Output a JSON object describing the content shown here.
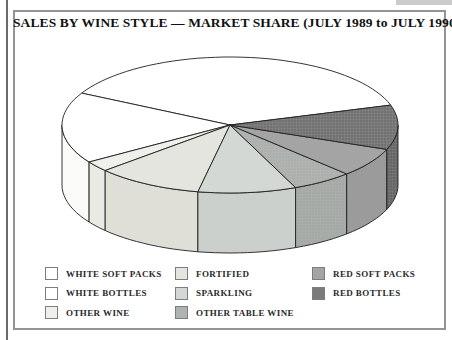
{
  "title": "SALES BY WINE STYLE — MARKET SHARE (JULY 1989 to JULY 1990)",
  "chart_data": {
    "type": "pie",
    "style": "3d-grayscale",
    "title": "SALES BY WINE STYLE — MARKET SHARE (JULY 1989 to JULY 1990)",
    "period": "JULY 1989 to JULY 1990",
    "legend_position": "bottom",
    "geometry": {
      "cx": 230,
      "cy": 125,
      "rx": 168,
      "ry": 68,
      "depth": 60
    },
    "slices": [
      {
        "label": "WHITE SOFT PACKS",
        "percent": 37.5,
        "start_deg": 17,
        "end_deg": 152,
        "color": "#ffffff",
        "side_color": "#fcfcfc",
        "texture": "none"
      },
      {
        "label": "WHITE BOTTLES",
        "percent": 16.9,
        "start_deg": 152,
        "end_deg": 213,
        "color": "#ffffff",
        "side_color": "#fbfbfa",
        "texture": "none"
      },
      {
        "label": "OTHER WINE",
        "percent": 2.5,
        "start_deg": 213,
        "end_deg": 222,
        "color": "#efefeb",
        "side_color": "#eaeae5",
        "texture": "none"
      },
      {
        "label": "FORTIFIED",
        "percent": 10.3,
        "start_deg": 222,
        "end_deg": 259,
        "color": "#e5e5e0",
        "side_color": "#dfdfd8",
        "texture": "none"
      },
      {
        "label": "SPARKLING",
        "percent": 9.4,
        "start_deg": 259,
        "end_deg": 293,
        "color": "#d4d8d4",
        "side_color": "#ccd0cc",
        "texture": "none"
      },
      {
        "label": "OTHER TABLE WINE",
        "percent": 5.8,
        "start_deg": 293,
        "end_deg": 314,
        "color": "#b0b4b0",
        "side_color": "#a9ada9",
        "texture": "dots"
      },
      {
        "label": "RED SOFT PACKS",
        "percent": 6.9,
        "start_deg": 314,
        "end_deg": 339,
        "color": "#a4a4a4",
        "side_color": "#9b9b9b",
        "texture": "none"
      },
      {
        "label": "RED BOTTLES",
        "percent": 10.6,
        "start_deg": 339,
        "end_deg": 377,
        "color": "#7b7b7b",
        "side_color": "#6f6f6f",
        "texture": "hatch"
      }
    ],
    "outline_color": "#1f1f1f"
  },
  "legend": {
    "columns": [
      [
        0,
        1,
        2
      ],
      [
        3,
        4,
        5
      ],
      [
        6,
        7
      ]
    ]
  }
}
